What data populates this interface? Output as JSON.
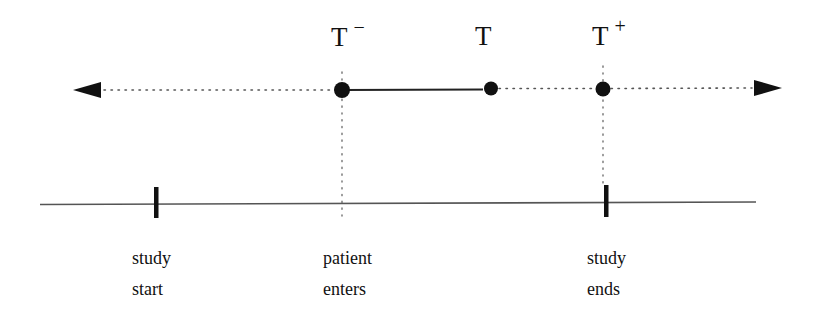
{
  "diagram": {
    "type": "timeline",
    "colors": {
      "ink": "#111111",
      "line": "#444444",
      "dotted": "#666666",
      "background": "#ffffff"
    },
    "time_axis": {
      "style": "dotted with arrowheads both ends",
      "points": [
        {
          "id": "t-minus",
          "label": "T",
          "superscript": "−",
          "x": 342
        },
        {
          "id": "t",
          "label": "T",
          "superscript": "",
          "x": 491
        },
        {
          "id": "t-plus",
          "label": "T",
          "superscript": "+",
          "x": 603
        }
      ],
      "solid_segment": {
        "from": "t-minus",
        "to": "t"
      }
    },
    "study_axis": {
      "style": "solid line",
      "markers": [
        {
          "id": "study-start",
          "line1": "study",
          "line2": "start",
          "x": 156,
          "tick": true
        },
        {
          "id": "patient-enters",
          "line1": "patient",
          "line2": "enters",
          "x": 342,
          "tick": false
        },
        {
          "id": "study-ends",
          "line1": "study",
          "line2": "ends",
          "x": 606,
          "tick": true
        }
      ]
    }
  }
}
